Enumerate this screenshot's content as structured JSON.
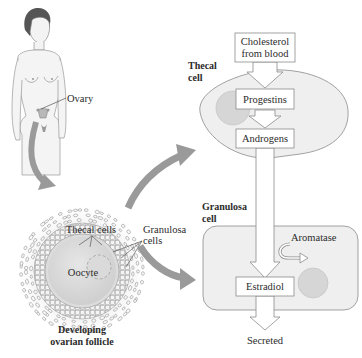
{
  "figure": {
    "human": {
      "ovary_label": "Ovary"
    },
    "follicle": {
      "thecal_cells_label": "Thecal cells",
      "granulosa_cells_label_line1": "Granulosa",
      "granulosa_cells_label_line2": "cells",
      "oocyte_label": "Oocyte",
      "caption_line1": "Developing",
      "caption_line2": "ovarian follicle"
    },
    "thecal_cell": {
      "label_line1": "Thecal",
      "label_line2": "cell"
    },
    "granulosa_cell": {
      "label_line1": "Granulosa",
      "label_line2": "cell"
    },
    "pathway": {
      "cholesterol_line1": "Cholesterol",
      "cholesterol_line2": "from blood",
      "progestins": "Progestins",
      "androgens": "Androgens",
      "aromatase": "Aromatase",
      "estradiol": "Estradiol",
      "secreted": "Secreted"
    },
    "colors": {
      "cell_fill": "#efefef",
      "nucleus_fill": "#d6d6d6",
      "arrow_gray": "#9a9a9a",
      "box_fill": "#ffffff",
      "outline": "#8c8c8c"
    }
  }
}
